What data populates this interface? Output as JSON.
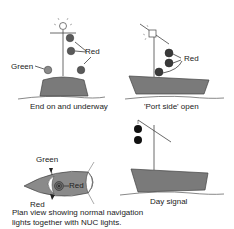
{
  "panels": {
    "end_on": {
      "caption": "End on and underway",
      "labels": {
        "red": "Red",
        "green": "Green"
      }
    },
    "port_side": {
      "caption": "'Port side' open",
      "labels": {
        "red": "Red"
      }
    },
    "plan_view": {
      "caption_line1": "Plan view showing normal navigation",
      "caption_line2": "lights together with NUC lights.",
      "labels": {
        "green": "Green",
        "red_center": "Red",
        "red_bottom": "Red"
      }
    },
    "day_signal": {
      "caption": "Day signal"
    }
  },
  "colors": {
    "hull": "#7a7a7a",
    "light_red": "#5a5a5a",
    "light_green": "#8a8a8a",
    "ball": "#111111",
    "line": "#444444"
  }
}
